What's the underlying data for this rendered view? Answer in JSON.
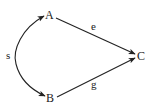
{
  "diagram": {
    "type": "directed-graph",
    "nodes": [
      {
        "id": "A",
        "label": "A"
      },
      {
        "id": "B",
        "label": "B"
      },
      {
        "id": "C",
        "label": "C"
      }
    ],
    "edges": [
      {
        "id": "e",
        "from": "A",
        "to": "C",
        "label": "e",
        "style": "straight"
      },
      {
        "id": "g",
        "from": "B",
        "to": "C",
        "label": "g",
        "style": "straight"
      },
      {
        "id": "s",
        "from": "A",
        "to": "B",
        "label": "s",
        "style": "curved-bidirectional"
      }
    ],
    "colors": {
      "stroke": "#222222",
      "background": "#ffffff"
    }
  }
}
